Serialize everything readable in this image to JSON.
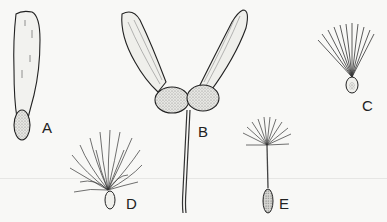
{
  "figure": {
    "labels": {
      "a": "A",
      "b": "B",
      "c": "C",
      "d": "D",
      "e": "E"
    }
  }
}
